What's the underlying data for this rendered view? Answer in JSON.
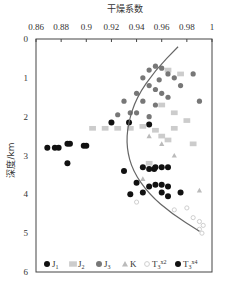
{
  "chart_data": {
    "type": "scatter",
    "title": "干燥系数",
    "xlabel": "干燥系数",
    "ylabel": "深度/km",
    "xlim": [
      0.86,
      1.0
    ],
    "ylim": [
      0,
      6
    ],
    "x_ticks": [
      "0.86",
      "0.88",
      "0.9",
      "0.92",
      "0.94",
      "0.96",
      "0.98",
      "1"
    ],
    "y_ticks": [
      "0",
      "1",
      "2",
      "3",
      "4",
      "5",
      "6"
    ],
    "y_inverted": true,
    "x_axis_position": "top",
    "grid": false,
    "legend_position": "bottom-inside",
    "legend": [
      {
        "label": "J1",
        "main": "J",
        "sub": "1",
        "sup": "",
        "marker": "circle",
        "color": "#111111"
      },
      {
        "label": "J2",
        "main": "J",
        "sub": "2",
        "sup": "",
        "marker": "square",
        "color": "#cccccc"
      },
      {
        "label": "J3",
        "main": "J",
        "sub": "3",
        "sup": "",
        "marker": "circle",
        "color": "#777777"
      },
      {
        "label": "K",
        "main": "K",
        "sub": "",
        "sup": "",
        "marker": "triangle",
        "color": "#bbbbbb"
      },
      {
        "label": "T3x2",
        "main": "T",
        "sub": "3",
        "sup": "x2",
        "marker": "circle-small",
        "color": "#cfcfcf"
      },
      {
        "label": "T3x4",
        "main": "T",
        "sub": "3",
        "sup": "x4",
        "marker": "circle",
        "color": "#111111"
      }
    ],
    "trend_curve": {
      "description": "dryness coefficient decreases then increases with depth",
      "points": [
        [
          0.973,
          0.2
        ],
        [
          0.955,
          0.8
        ],
        [
          0.94,
          1.5
        ],
        [
          0.933,
          2.2
        ],
        [
          0.932,
          2.8
        ],
        [
          0.937,
          3.4
        ],
        [
          0.95,
          4.0
        ],
        [
          0.968,
          4.5
        ],
        [
          0.99,
          4.95
        ]
      ]
    },
    "series": [
      {
        "name": "J1",
        "points": [
          [
            0.869,
            2.8
          ],
          [
            0.875,
            2.8
          ],
          [
            0.878,
            2.8
          ],
          [
            0.885,
            2.7
          ],
          [
            0.887,
            2.7
          ],
          [
            0.898,
            2.75
          ],
          [
            0.9,
            2.75
          ],
          [
            0.93,
            3.4
          ],
          [
            0.954,
            3.35
          ],
          [
            0.92,
            2.15
          ],
          [
            0.95,
            2.2
          ],
          [
            0.885,
            3.2
          ],
          [
            0.934,
            2.15
          ]
        ]
      },
      {
        "name": "J2",
        "points": [
          [
            0.905,
            2.3
          ],
          [
            0.915,
            2.3
          ],
          [
            0.925,
            2.3
          ],
          [
            0.935,
            2.3
          ],
          [
            0.945,
            2.25
          ],
          [
            0.955,
            2.35
          ],
          [
            0.96,
            2.5
          ],
          [
            0.965,
            2.6
          ],
          [
            0.97,
            2.3
          ],
          [
            0.98,
            2.1
          ],
          [
            0.985,
            2.7
          ],
          [
            0.95,
            3.2
          ],
          [
            0.96,
            1.7
          ],
          [
            0.97,
            1.9
          ],
          [
            0.965,
            0.8
          ],
          [
            0.975,
            0.9
          ]
        ]
      },
      {
        "name": "J3",
        "points": [
          [
            0.95,
            0.8
          ],
          [
            0.955,
            0.7
          ],
          [
            0.96,
            0.75
          ],
          [
            0.965,
            0.9
          ],
          [
            0.97,
            1.0
          ],
          [
            0.945,
            1.0
          ],
          [
            0.95,
            1.2
          ],
          [
            0.955,
            1.3
          ],
          [
            0.94,
            1.4
          ],
          [
            0.96,
            1.4
          ],
          [
            0.965,
            1.5
          ],
          [
            0.945,
            1.6
          ],
          [
            0.955,
            1.7
          ],
          [
            0.94,
            1.9
          ],
          [
            0.95,
            2.0
          ],
          [
            0.935,
            1.9
          ],
          [
            0.93,
            1.6
          ],
          [
            0.925,
            1.95
          ],
          [
            0.958,
            1.05
          ],
          [
            0.975,
            1.2
          ],
          [
            0.985,
            0.9
          ],
          [
            0.99,
            1.6
          ]
        ]
      },
      {
        "name": "K",
        "points": [
          [
            0.95,
            2.5
          ],
          [
            0.96,
            2.7
          ],
          [
            0.945,
            3.6
          ],
          [
            0.97,
            3.0
          ],
          [
            0.99,
            3.9
          ]
        ]
      },
      {
        "name": "T3x2",
        "points": [
          [
            0.97,
            4.4
          ],
          [
            0.98,
            4.35
          ],
          [
            0.985,
            4.6
          ],
          [
            0.99,
            4.7
          ],
          [
            0.99,
            4.9
          ],
          [
            0.992,
            5.0
          ],
          [
            0.993,
            4.8
          ],
          [
            0.94,
            4.2
          ]
        ]
      },
      {
        "name": "T3x4",
        "points": [
          [
            0.945,
            3.3
          ],
          [
            0.95,
            3.35
          ],
          [
            0.955,
            3.3
          ],
          [
            0.96,
            3.3
          ],
          [
            0.965,
            3.3
          ],
          [
            0.95,
            3.8
          ],
          [
            0.955,
            3.75
          ],
          [
            0.96,
            3.75
          ],
          [
            0.965,
            3.8
          ],
          [
            0.96,
            3.95
          ],
          [
            0.965,
            4.05
          ],
          [
            0.975,
            3.95
          ],
          [
            0.945,
            3.95
          ],
          [
            0.94,
            3.7
          ],
          [
            0.935,
            4.0
          ]
        ]
      }
    ]
  }
}
